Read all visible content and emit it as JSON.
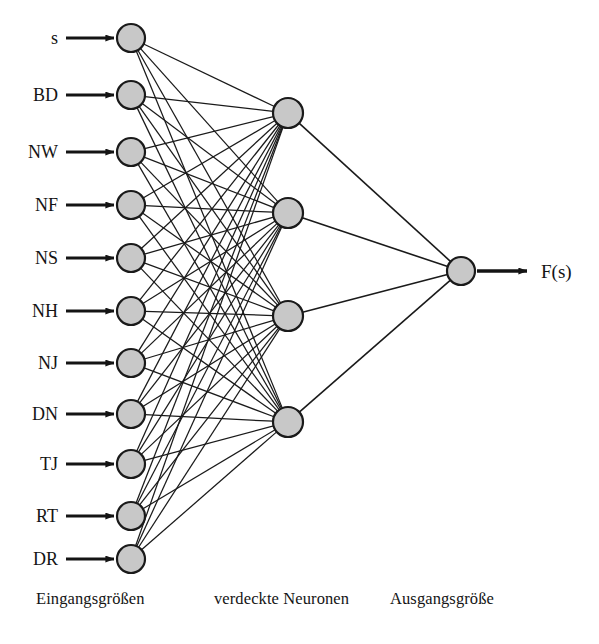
{
  "diagram": {
    "type": "feedforward-neural-network",
    "background_color": "#ffffff",
    "node_fill_color": "#c8c8c8",
    "node_stroke_color": "#1a1a1a",
    "edge_color": "#1a1a1a"
  },
  "layers": {
    "input": {
      "caption": "Eingangsgrößen",
      "count": 11,
      "nodes": [
        {
          "label": "s",
          "cx": 131,
          "cy": 38,
          "r": 14
        },
        {
          "label": "BD",
          "cx": 131,
          "cy": 95,
          "r": 14
        },
        {
          "label": "NW",
          "cx": 131,
          "cy": 152,
          "r": 14
        },
        {
          "label": "NF",
          "cx": 131,
          "cy": 205,
          "r": 14
        },
        {
          "label": "NS",
          "cx": 131,
          "cy": 258,
          "r": 14
        },
        {
          "label": "NH",
          "cx": 131,
          "cy": 311,
          "r": 14
        },
        {
          "label": "NJ",
          "cx": 131,
          "cy": 363,
          "r": 14
        },
        {
          "label": "DN",
          "cx": 131,
          "cy": 414,
          "r": 14
        },
        {
          "label": "TJ",
          "cx": 131,
          "cy": 464,
          "r": 14
        },
        {
          "label": "RT",
          "cx": 131,
          "cy": 516,
          "r": 14
        },
        {
          "label": "DR",
          "cx": 131,
          "cy": 559,
          "r": 14
        }
      ]
    },
    "hidden": {
      "caption": "verdeckte Neuronen",
      "count": 4,
      "nodes": [
        {
          "label": "",
          "cx": 288,
          "cy": 113,
          "r": 15
        },
        {
          "label": "",
          "cx": 288,
          "cy": 213,
          "r": 15
        },
        {
          "label": "",
          "cx": 288,
          "cy": 316,
          "r": 15
        },
        {
          "label": "",
          "cx": 288,
          "cy": 422,
          "r": 15
        }
      ]
    },
    "output": {
      "caption": "Ausgangsgröße",
      "count": 1,
      "nodes": [
        {
          "label": "F(s)",
          "cx": 461,
          "cy": 271,
          "r": 14
        }
      ]
    }
  },
  "input_arrows": {
    "x_start": 66,
    "x_end": 114,
    "description": "horizontal arrow from label into each input neuron"
  },
  "output_arrow": {
    "x_start": 477,
    "x_end": 527,
    "y": 271,
    "label": "F(s)",
    "label_x": 541,
    "label_y": 271
  },
  "connections": {
    "input_to_hidden": "fully-connected",
    "hidden_to_output": "fully-connected",
    "input_to_hidden_count": 44,
    "hidden_to_output_count": 4
  }
}
